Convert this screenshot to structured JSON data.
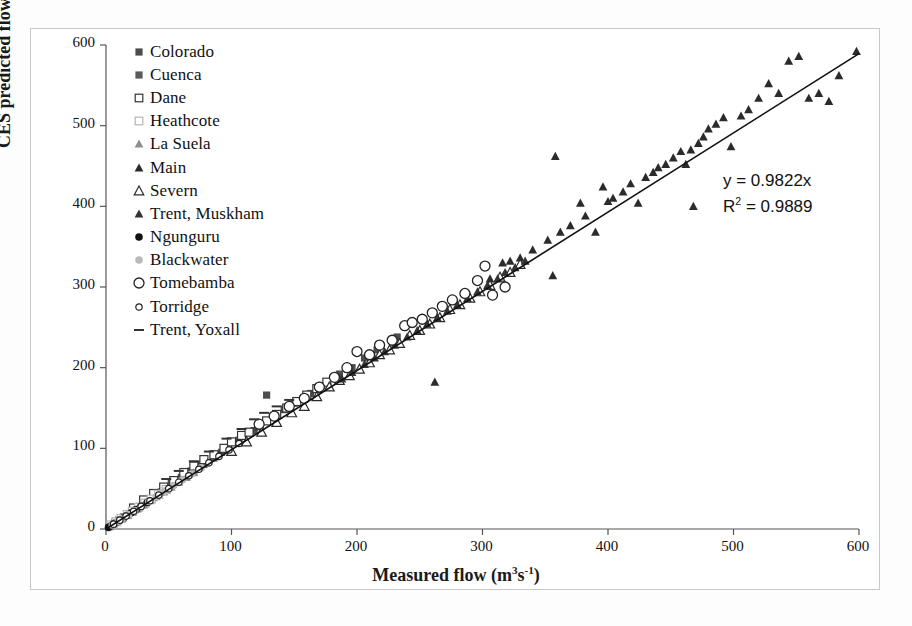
{
  "chart_data": {
    "type": "scatter",
    "title": "",
    "xlabel": "Measured flow (m3 s-1)",
    "ylabel": "CES predicted flow (m3 s-1)",
    "xlabel_html": "Measured flow (m<sup>3</sup>s<sup>-1</sup>)",
    "ylabel_html": "CES predicted flow (m<sup>3</sup> s<sup>-1</sup>)",
    "xlim": [
      0,
      600
    ],
    "ylim": [
      0,
      600
    ],
    "xticks": [
      0,
      100,
      200,
      300,
      400,
      500,
      600
    ],
    "yticks": [
      0,
      100,
      200,
      300,
      400,
      500,
      600
    ],
    "grid": false,
    "legend_position": "upper-left-inside",
    "annotations": {
      "equation": "y = 0.9822x",
      "r_squared_text": "R2 = 0.9889",
      "r_squared_base": "R",
      "r_squared_exp": "2",
      "r_squared_value": "= 0.9889"
    },
    "trendline": {
      "type": "linear-through-origin",
      "slope": 0.9822,
      "intercept": 0,
      "r2": 0.9889,
      "x_start": 0,
      "x_end": 600,
      "color": "#111111"
    },
    "series": [
      {
        "name": "Colorado",
        "marker": "filled-square",
        "color": "#4d4d4d",
        "points": [
          [
            52,
            58
          ],
          [
            60,
            64
          ],
          [
            68,
            72
          ],
          [
            76,
            80
          ],
          [
            86,
            90
          ],
          [
            96,
            100
          ],
          [
            106,
            110
          ],
          [
            118,
            122
          ],
          [
            128,
            166
          ],
          [
            134,
            140
          ],
          [
            142,
            148
          ],
          [
            150,
            156
          ],
          [
            163,
            168
          ],
          [
            172,
            178
          ],
          [
            186,
            192
          ],
          [
            196,
            200
          ],
          [
            206,
            212
          ],
          [
            216,
            222
          ],
          [
            232,
            238
          ]
        ]
      },
      {
        "name": "Cuenca",
        "marker": "filled-square",
        "color": "#5a5a5a",
        "points": [
          [
            7,
            8
          ],
          [
            10,
            11
          ],
          [
            14,
            15
          ],
          [
            18,
            19
          ],
          [
            22,
            23
          ],
          [
            27,
            28
          ],
          [
            32,
            33
          ],
          [
            38,
            39
          ],
          [
            44,
            46
          ],
          [
            50,
            52
          ],
          [
            56,
            58
          ],
          [
            63,
            65
          ],
          [
            70,
            72
          ],
          [
            78,
            80
          ],
          [
            86,
            88
          ],
          [
            92,
            95
          ]
        ]
      },
      {
        "name": "Dane",
        "marker": "open-square",
        "color": "#333333",
        "points": [
          [
            22,
            26
          ],
          [
            30,
            36
          ],
          [
            38,
            44
          ],
          [
            46,
            52
          ],
          [
            54,
            60
          ],
          [
            62,
            70
          ],
          [
            70,
            78
          ],
          [
            78,
            86
          ],
          [
            86,
            92
          ],
          [
            94,
            100
          ],
          [
            100,
            108
          ],
          [
            108,
            116
          ],
          [
            114,
            120
          ],
          [
            122,
            128
          ],
          [
            128,
            134
          ],
          [
            136,
            142
          ],
          [
            144,
            150
          ],
          [
            152,
            158
          ],
          [
            160,
            166
          ],
          [
            168,
            174
          ],
          [
            176,
            182
          ]
        ]
      },
      {
        "name": "Heathcote",
        "marker": "open-square",
        "color": "#b5b5b5",
        "points": [
          [
            4,
            5
          ],
          [
            8,
            9
          ],
          [
            12,
            13
          ],
          [
            17,
            18
          ],
          [
            21,
            22
          ],
          [
            26,
            27
          ],
          [
            31,
            32
          ],
          [
            36,
            37
          ],
          [
            42,
            43
          ],
          [
            48,
            49
          ]
        ]
      },
      {
        "name": "La Suela",
        "marker": "filled-triangle",
        "color": "#8f8f8f",
        "points": [
          [
            3,
            3
          ],
          [
            6,
            6
          ],
          [
            9,
            9
          ],
          [
            13,
            13
          ],
          [
            17,
            17
          ],
          [
            21,
            21
          ],
          [
            25,
            25
          ],
          [
            30,
            30
          ],
          [
            35,
            35
          ],
          [
            40,
            40
          ],
          [
            46,
            46
          ],
          [
            52,
            52
          ],
          [
            58,
            58
          ],
          [
            64,
            64
          ],
          [
            70,
            70
          ]
        ]
      },
      {
        "name": "Main",
        "marker": "filled-triangle",
        "color": "#2b2b2b",
        "points": [
          [
            262,
            182
          ],
          [
            306,
            310
          ],
          [
            316,
            330
          ],
          [
            322,
            332
          ],
          [
            330,
            336
          ],
          [
            340,
            346
          ],
          [
            352,
            358
          ],
          [
            356,
            314
          ],
          [
            358,
            462
          ],
          [
            362,
            368
          ],
          [
            370,
            376
          ],
          [
            378,
            404
          ],
          [
            382,
            388
          ],
          [
            390,
            368
          ],
          [
            396,
            424
          ],
          [
            400,
            406
          ],
          [
            404,
            410
          ],
          [
            412,
            418
          ],
          [
            418,
            428
          ],
          [
            424,
            404
          ],
          [
            430,
            436
          ],
          [
            436,
            442
          ],
          [
            440,
            448
          ],
          [
            446,
            452
          ],
          [
            452,
            460
          ],
          [
            458,
            468
          ],
          [
            462,
            452
          ],
          [
            466,
            470
          ],
          [
            468,
            400
          ],
          [
            472,
            478
          ],
          [
            476,
            486
          ],
          [
            480,
            496
          ],
          [
            486,
            502
          ],
          [
            492,
            510
          ],
          [
            498,
            474
          ],
          [
            506,
            512
          ],
          [
            512,
            520
          ],
          [
            520,
            534
          ],
          [
            528,
            552
          ],
          [
            536,
            540
          ],
          [
            544,
            580
          ],
          [
            552,
            586
          ],
          [
            560,
            534
          ],
          [
            568,
            540
          ],
          [
            576,
            530
          ],
          [
            584,
            562
          ],
          [
            598,
            592
          ]
        ]
      },
      {
        "name": "Severn",
        "marker": "open-triangle",
        "color": "#2b2b2b",
        "points": [
          [
            100,
            96
          ],
          [
            112,
            108
          ],
          [
            124,
            120
          ],
          [
            136,
            132
          ],
          [
            148,
            144
          ],
          [
            158,
            152
          ],
          [
            168,
            164
          ],
          [
            178,
            176
          ],
          [
            186,
            184
          ],
          [
            194,
            190
          ],
          [
            202,
            198
          ],
          [
            210,
            206
          ],
          [
            218,
            216
          ],
          [
            226,
            222
          ],
          [
            234,
            230
          ],
          [
            242,
            240
          ],
          [
            250,
            246
          ],
          [
            258,
            254
          ],
          [
            266,
            262
          ],
          [
            274,
            272
          ],
          [
            282,
            278
          ],
          [
            290,
            286
          ],
          [
            298,
            294
          ],
          [
            306,
            302
          ],
          [
            314,
            312
          ],
          [
            322,
            318
          ],
          [
            330,
            328
          ]
        ]
      },
      {
        "name": "Trent, Muskham",
        "marker": "filled-triangle",
        "color": "#333333",
        "points": [
          [
            188,
            186
          ],
          [
            196,
            194
          ],
          [
            206,
            204
          ],
          [
            214,
            212
          ],
          [
            222,
            220
          ],
          [
            230,
            228
          ],
          [
            240,
            238
          ],
          [
            248,
            246
          ],
          [
            256,
            254
          ],
          [
            264,
            262
          ],
          [
            272,
            270
          ],
          [
            280,
            278
          ],
          [
            288,
            286
          ],
          [
            296,
            294
          ],
          [
            304,
            302
          ],
          [
            312,
            310
          ],
          [
            318,
            318
          ],
          [
            326,
            324
          ],
          [
            334,
            332
          ]
        ]
      },
      {
        "name": "Ngunguru",
        "marker": "filled-circle",
        "color": "#111111",
        "points": [
          [
            2,
            2
          ],
          [
            4,
            4
          ],
          [
            6,
            6
          ],
          [
            8,
            8
          ],
          [
            11,
            11
          ],
          [
            14,
            14
          ],
          [
            17,
            17
          ],
          [
            20,
            20
          ],
          [
            24,
            24
          ],
          [
            28,
            28
          ],
          [
            33,
            33
          ]
        ]
      },
      {
        "name": "Blackwater",
        "marker": "filled-circle",
        "color": "#b9b9b9",
        "points": [
          [
            5,
            5
          ],
          [
            9,
            9
          ],
          [
            13,
            13
          ],
          [
            18,
            18
          ],
          [
            23,
            23
          ],
          [
            28,
            28
          ],
          [
            34,
            34
          ],
          [
            40,
            40
          ],
          [
            47,
            47
          ],
          [
            54,
            54
          ],
          [
            61,
            61
          ],
          [
            68,
            68
          ],
          [
            76,
            76
          ]
        ]
      },
      {
        "name": "Tomebamba",
        "marker": "open-circle-large",
        "color": "#222222",
        "points": [
          [
            122,
            130
          ],
          [
            134,
            140
          ],
          [
            146,
            152
          ],
          [
            158,
            162
          ],
          [
            170,
            176
          ],
          [
            182,
            188
          ],
          [
            192,
            200
          ],
          [
            200,
            220
          ],
          [
            210,
            216
          ],
          [
            218,
            228
          ],
          [
            228,
            234
          ],
          [
            238,
            252
          ],
          [
            244,
            256
          ],
          [
            252,
            260
          ],
          [
            260,
            268
          ],
          [
            268,
            276
          ],
          [
            276,
            284
          ],
          [
            286,
            292
          ],
          [
            296,
            308
          ],
          [
            302,
            326
          ],
          [
            308,
            290
          ],
          [
            318,
            300
          ]
        ]
      },
      {
        "name": "Torridge",
        "marker": "open-circle-small",
        "color": "#222222",
        "points": [
          [
            6,
            6
          ],
          [
            11,
            11
          ],
          [
            16,
            16
          ],
          [
            22,
            22
          ],
          [
            28,
            28
          ],
          [
            35,
            35
          ],
          [
            42,
            42
          ],
          [
            50,
            50
          ],
          [
            58,
            58
          ],
          [
            66,
            66
          ],
          [
            74,
            74
          ],
          [
            82,
            82
          ],
          [
            90,
            90
          ],
          [
            98,
            98
          ],
          [
            106,
            106
          ]
        ]
      },
      {
        "name": "Trent, Yoxall",
        "marker": "dash",
        "color": "#333333",
        "points": [
          [
            48,
            62
          ],
          [
            58,
            72
          ],
          [
            70,
            84
          ],
          [
            82,
            96
          ],
          [
            96,
            112
          ],
          [
            108,
            124
          ],
          [
            118,
            136
          ],
          [
            126,
            144
          ],
          [
            136,
            152
          ],
          [
            146,
            160
          ]
        ]
      }
    ]
  },
  "legend": {
    "items": [
      {
        "label": "Colorado",
        "marker": "filled-square",
        "color": "#4d4d4d"
      },
      {
        "label": "Cuenca",
        "marker": "filled-square",
        "color": "#5a5a5a"
      },
      {
        "label": "Dane",
        "marker": "open-square",
        "color": "#333333"
      },
      {
        "label": "Heathcote",
        "marker": "open-square",
        "color": "#b5b5b5"
      },
      {
        "label": "La Suela",
        "marker": "filled-triangle",
        "color": "#8f8f8f"
      },
      {
        "label": "Main",
        "marker": "filled-triangle",
        "color": "#2b2b2b"
      },
      {
        "label": "Severn",
        "marker": "open-triangle",
        "color": "#2b2b2b"
      },
      {
        "label": "Trent, Muskham",
        "marker": "filled-triangle",
        "color": "#333333"
      },
      {
        "label": "Ngunguru",
        "marker": "filled-circle",
        "color": "#111111"
      },
      {
        "label": "Blackwater",
        "marker": "filled-circle",
        "color": "#b9b9b9"
      },
      {
        "label": "Tomebamba",
        "marker": "open-circle-large",
        "color": "#222222"
      },
      {
        "label": "Torridge",
        "marker": "open-circle-small",
        "color": "#222222"
      },
      {
        "label": "Trent, Yoxall",
        "marker": "dash",
        "color": "#333333"
      }
    ]
  },
  "axes": {
    "x_tick_labels": [
      "0",
      "100",
      "200",
      "300",
      "400",
      "500",
      "600"
    ],
    "y_tick_labels": [
      "0",
      "100",
      "200",
      "300",
      "400",
      "500",
      "600"
    ]
  }
}
